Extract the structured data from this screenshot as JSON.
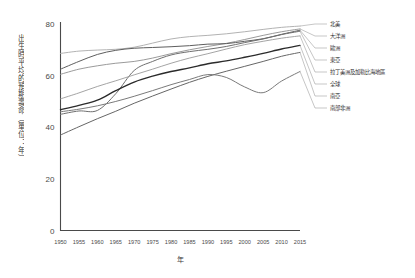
{
  "chart_data": {
    "type": "line",
    "title": "",
    "xlabel": "年",
    "ylabel": "出生時平均的預期壽命（單位：年）",
    "xlim": [
      1950,
      2015
    ],
    "ylim": [
      0,
      80
    ],
    "grid": false,
    "legend_position": "right-callout",
    "x": [
      1950,
      1955,
      1960,
      1965,
      1970,
      1975,
      1980,
      1985,
      1990,
      1995,
      2000,
      2005,
      2010,
      2015
    ],
    "xticklabels": [
      "1950",
      "1955",
      "1960",
      "1965",
      "1970",
      "1975",
      "1980",
      "1985",
      "1990",
      "1995",
      "2000",
      "2005",
      "2010",
      "2015"
    ],
    "yticklabels": [
      "0",
      "20",
      "40",
      "60",
      "80"
    ],
    "yticks": [
      0,
      20,
      40,
      60,
      80
    ],
    "series": [
      {
        "name": "北美",
        "color": "#a9a9a9",
        "width": 0.9,
        "values": [
          68.6,
          69.5,
          69.9,
          70.2,
          71.0,
          72.6,
          74.2,
          75.1,
          75.6,
          76.2,
          77.0,
          77.9,
          78.7,
          79.2
        ]
      },
      {
        "name": "大洋洲",
        "color": "#8e8e8e",
        "width": 0.9,
        "values": [
          60.5,
          62.5,
          63.8,
          64.8,
          65.5,
          66.8,
          68.5,
          70.0,
          71.3,
          72.5,
          74.0,
          75.6,
          77.0,
          78.1
        ]
      },
      {
        "name": "歐洲",
        "color": "#5e5e5e",
        "width": 1.0,
        "values": [
          62.5,
          65.5,
          68.2,
          69.8,
          70.6,
          70.9,
          71.2,
          71.6,
          72.2,
          72.4,
          73.3,
          74.3,
          76.0,
          77.6
        ]
      },
      {
        "name": "東亞",
        "color": "#6f6f6f",
        "width": 1.0,
        "values": [
          45.0,
          46.3,
          46.5,
          53.0,
          62.0,
          65.5,
          68.0,
          69.3,
          70.2,
          71.3,
          72.8,
          74.2,
          75.9,
          77.2
        ]
      },
      {
        "name": "拉丁美洲及加勒比海地區",
        "color": "#9a9a9a",
        "width": 0.9,
        "values": [
          51.0,
          53.3,
          55.8,
          58.0,
          60.3,
          62.5,
          64.8,
          66.8,
          68.5,
          70.3,
          72.0,
          73.3,
          74.5,
          75.4
        ]
      },
      {
        "name": "全球",
        "color": "#2b2b2b",
        "width": 1.4,
        "values": [
          46.8,
          48.5,
          50.5,
          54.2,
          57.5,
          59.8,
          61.6,
          63.0,
          64.6,
          65.7,
          67.1,
          68.6,
          70.3,
          71.7
        ]
      },
      {
        "name": "南亞",
        "color": "#666666",
        "width": 1.0,
        "values": [
          37.0,
          40.2,
          43.3,
          46.2,
          49.3,
          52.1,
          54.8,
          57.4,
          59.7,
          61.7,
          63.6,
          65.5,
          67.5,
          69.0
        ]
      },
      {
        "name": "撒哈拉以南非洲",
        "color": "#7a7a7a",
        "width": 1.0,
        "values": [
          46.0,
          47.0,
          48.3,
          50.0,
          52.0,
          54.2,
          56.5,
          58.5,
          60.4,
          59.3,
          55.6,
          53.4,
          57.9,
          61.6
        ]
      }
    ],
    "legend_labels": [
      "北美",
      "大洋洲",
      "歐洲",
      "東亞",
      "拉丁美洲及加勒比海地區",
      "全球",
      "南亞",
      "南部非洲"
    ]
  }
}
